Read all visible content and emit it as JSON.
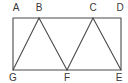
{
  "diagram": {
    "type": "geometry",
    "stroke_color": "#4a4a4a",
    "label_color": "#3a3a3a",
    "points": {
      "A": {
        "x": 13,
        "y": 18,
        "label": "A",
        "lx": 16,
        "ly": 11
      },
      "B": {
        "x": 39,
        "y": 18,
        "label": "B",
        "lx": 39,
        "ly": 11
      },
      "C": {
        "x": 93,
        "y": 18,
        "label": "C",
        "lx": 93,
        "ly": 11
      },
      "D": {
        "x": 121,
        "y": 18,
        "label": "D",
        "lx": 120,
        "ly": 11
      },
      "G": {
        "x": 13,
        "y": 70,
        "label": "G",
        "lx": 13,
        "ly": 81
      },
      "F": {
        "x": 67,
        "y": 70,
        "label": "F",
        "lx": 67,
        "ly": 81
      },
      "E": {
        "x": 121,
        "y": 70,
        "label": "E",
        "lx": 119,
        "ly": 81
      }
    },
    "rectangle": [
      "A",
      "D",
      "E",
      "G"
    ],
    "segments": [
      [
        "G",
        "B"
      ],
      [
        "B",
        "F"
      ],
      [
        "F",
        "C"
      ],
      [
        "C",
        "E"
      ]
    ]
  }
}
